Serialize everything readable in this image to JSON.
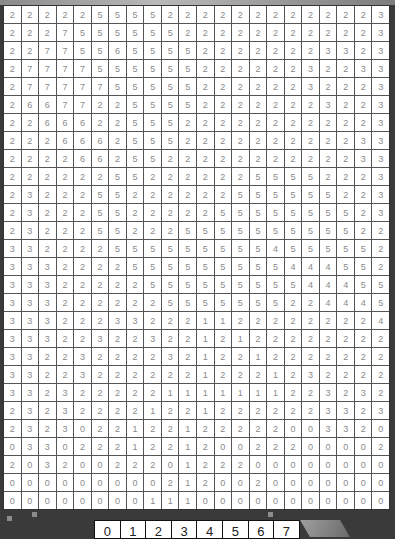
{
  "grid": {
    "columns": 22,
    "rows": [
      [
        2,
        2,
        2,
        2,
        2,
        5,
        5,
        5,
        5,
        2,
        2,
        2,
        2,
        2,
        2,
        2,
        2,
        2,
        2,
        2,
        2,
        3
      ],
      [
        2,
        2,
        2,
        7,
        5,
        5,
        5,
        5,
        5,
        5,
        2,
        2,
        2,
        2,
        2,
        2,
        2,
        2,
        2,
        2,
        2,
        3
      ],
      [
        2,
        2,
        7,
        7,
        5,
        5,
        6,
        5,
        5,
        5,
        5,
        2,
        2,
        2,
        2,
        2,
        2,
        2,
        3,
        3,
        2,
        3
      ],
      [
        2,
        7,
        7,
        7,
        7,
        5,
        5,
        5,
        5,
        5,
        5,
        2,
        2,
        2,
        2,
        2,
        2,
        3,
        2,
        2,
        3,
        3
      ],
      [
        2,
        7,
        7,
        7,
        7,
        7,
        5,
        5,
        5,
        5,
        5,
        2,
        2,
        2,
        2,
        2,
        2,
        3,
        2,
        2,
        2,
        3
      ],
      [
        2,
        6,
        6,
        7,
        7,
        2,
        2,
        5,
        5,
        5,
        5,
        2,
        2,
        2,
        2,
        2,
        2,
        2,
        3,
        2,
        2,
        3
      ],
      [
        2,
        2,
        6,
        6,
        6,
        2,
        2,
        5,
        5,
        5,
        2,
        2,
        2,
        2,
        2,
        2,
        2,
        2,
        2,
        2,
        2,
        3
      ],
      [
        2,
        2,
        2,
        6,
        6,
        6,
        2,
        5,
        5,
        5,
        2,
        2,
        2,
        2,
        2,
        2,
        2,
        2,
        2,
        2,
        3,
        3
      ],
      [
        2,
        2,
        2,
        2,
        6,
        6,
        2,
        5,
        5,
        2,
        2,
        2,
        2,
        2,
        2,
        2,
        2,
        2,
        2,
        2,
        3,
        3
      ],
      [
        2,
        2,
        2,
        2,
        2,
        2,
        5,
        5,
        2,
        2,
        2,
        2,
        2,
        2,
        5,
        5,
        5,
        5,
        2,
        2,
        2,
        3
      ],
      [
        2,
        3,
        2,
        2,
        2,
        5,
        5,
        2,
        2,
        2,
        2,
        2,
        2,
        5,
        5,
        5,
        5,
        5,
        5,
        2,
        2,
        3
      ],
      [
        2,
        3,
        2,
        2,
        2,
        5,
        5,
        2,
        2,
        2,
        2,
        2,
        5,
        5,
        5,
        5,
        5,
        5,
        5,
        5,
        2,
        3
      ],
      [
        2,
        3,
        2,
        2,
        2,
        5,
        5,
        2,
        2,
        2,
        5,
        5,
        5,
        5,
        5,
        5,
        5,
        5,
        5,
        5,
        2,
        2
      ],
      [
        3,
        3,
        2,
        2,
        2,
        2,
        5,
        5,
        5,
        5,
        5,
        5,
        5,
        5,
        5,
        4,
        5,
        5,
        5,
        5,
        5,
        2
      ],
      [
        3,
        3,
        3,
        2,
        2,
        2,
        2,
        5,
        5,
        5,
        5,
        5,
        5,
        5,
        5,
        5,
        4,
        4,
        4,
        5,
        5,
        2
      ],
      [
        3,
        3,
        3,
        2,
        2,
        2,
        2,
        2,
        5,
        5,
        5,
        5,
        5,
        5,
        5,
        5,
        5,
        4,
        4,
        4,
        5,
        5
      ],
      [
        3,
        3,
        3,
        2,
        2,
        2,
        2,
        2,
        2,
        5,
        5,
        5,
        5,
        5,
        5,
        5,
        2,
        2,
        4,
        4,
        4,
        5
      ],
      [
        3,
        3,
        3,
        2,
        2,
        2,
        3,
        3,
        2,
        2,
        2,
        1,
        1,
        2,
        2,
        2,
        2,
        2,
        2,
        2,
        2,
        4
      ],
      [
        3,
        3,
        3,
        2,
        2,
        3,
        2,
        2,
        3,
        2,
        2,
        1,
        2,
        1,
        2,
        2,
        2,
        2,
        2,
        2,
        2,
        2
      ],
      [
        3,
        3,
        2,
        2,
        3,
        2,
        2,
        2,
        2,
        3,
        2,
        1,
        2,
        2,
        1,
        2,
        2,
        2,
        2,
        2,
        2,
        2
      ],
      [
        3,
        3,
        2,
        2,
        3,
        2,
        2,
        2,
        2,
        2,
        2,
        1,
        2,
        2,
        2,
        1,
        2,
        3,
        2,
        2,
        2,
        2
      ],
      [
        3,
        3,
        2,
        3,
        2,
        2,
        2,
        2,
        2,
        1,
        1,
        1,
        1,
        1,
        1,
        1,
        2,
        2,
        3,
        2,
        3,
        2
      ],
      [
        2,
        3,
        2,
        3,
        2,
        2,
        2,
        2,
        1,
        2,
        2,
        1,
        2,
        2,
        2,
        2,
        2,
        2,
        3,
        3,
        2,
        3
      ],
      [
        2,
        3,
        2,
        3,
        0,
        2,
        2,
        1,
        2,
        2,
        1,
        2,
        2,
        2,
        2,
        2,
        0,
        0,
        3,
        3,
        2,
        0
      ],
      [
        0,
        3,
        3,
        0,
        2,
        2,
        2,
        1,
        2,
        2,
        1,
        2,
        0,
        0,
        2,
        2,
        2,
        0,
        0,
        0,
        0,
        2
      ],
      [
        2,
        0,
        3,
        2,
        0,
        0,
        2,
        2,
        2,
        0,
        1,
        2,
        2,
        2,
        0,
        0,
        0,
        0,
        0,
        0,
        0,
        0
      ],
      [
        0,
        0,
        0,
        0,
        0,
        0,
        0,
        0,
        0,
        2,
        1,
        2,
        0,
        0,
        2,
        0,
        0,
        0,
        0,
        0,
        0,
        0
      ],
      [
        0,
        0,
        0,
        0,
        0,
        0,
        0,
        0,
        1,
        1,
        1,
        0,
        0,
        0,
        0,
        0,
        0,
        0,
        0,
        0,
        0,
        0
      ]
    ]
  },
  "palette": {
    "options": [
      "0",
      "1",
      "2",
      "3",
      "4",
      "5",
      "6",
      "7"
    ]
  }
}
